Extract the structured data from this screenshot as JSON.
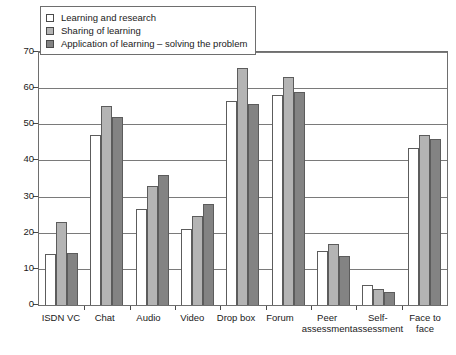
{
  "chart_data": {
    "type": "bar",
    "title": "",
    "xlabel": "",
    "ylabel": "",
    "ylim": [
      0,
      70
    ],
    "yticks": [
      0,
      10,
      20,
      30,
      40,
      50,
      60,
      70
    ],
    "grid": true,
    "legend_position": "top-left",
    "categories": [
      "ISDN VC",
      "Chat",
      "Audio",
      "Video",
      "Drop box",
      "Forum",
      "Peer\nassessment",
      "Self-\nassessment",
      "Face to\nface"
    ],
    "series": [
      {
        "name": "Learning and research",
        "color": "#ffffff",
        "values": [
          14,
          47,
          26.5,
          21,
          56.5,
          58,
          15,
          5.5,
          43.5
        ]
      },
      {
        "name": "Sharing of learning",
        "color": "#b4b4b4",
        "values": [
          23,
          55,
          33,
          24.5,
          65.5,
          63,
          17,
          4.5,
          47
        ]
      },
      {
        "name": "Application of learning – solving the problem",
        "color": "#838383",
        "values": [
          14.5,
          52,
          36,
          28,
          55.5,
          59,
          13.5,
          3.5,
          46
        ]
      }
    ]
  }
}
